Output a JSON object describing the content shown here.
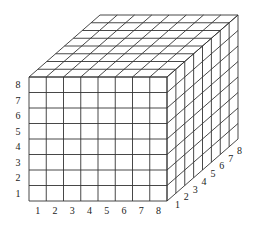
{
  "diagram": {
    "divisions": 8,
    "colors": {
      "line": "#333333",
      "text": "#222222",
      "background": "#ffffff"
    },
    "geometry": {
      "front": {
        "x0": 29,
        "y0": 77,
        "x1": 167,
        "y1": 201
      },
      "depth": {
        "dx": 71,
        "dy": -62
      }
    },
    "labels": {
      "vertical_axis": [
        "1",
        "2",
        "3",
        "4",
        "5",
        "6",
        "7",
        "8"
      ],
      "horizontal_axis": [
        "1",
        "2",
        "3",
        "4",
        "5",
        "6",
        "7",
        "8"
      ],
      "depth_axis": [
        "1",
        "2",
        "3",
        "4",
        "5",
        "6",
        "7",
        "8"
      ]
    }
  }
}
